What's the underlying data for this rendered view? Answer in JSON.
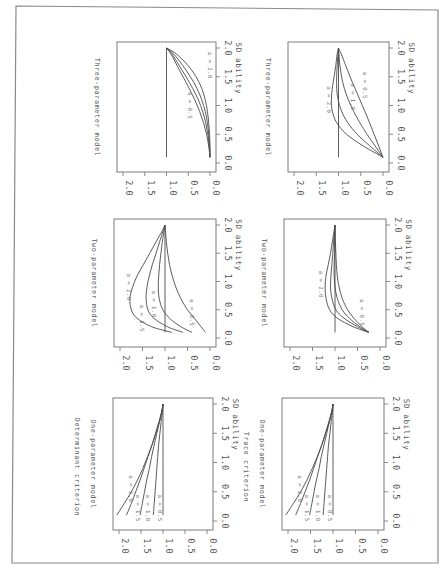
{
  "figure": {
    "orientation": "rotated-90-clockwise",
    "criteria": [
      "Determinant criterion",
      "Trace criterion"
    ]
  },
  "chart_data": [
    {
      "type": "line",
      "id": "det-one",
      "criterion": "Determinant criterion",
      "title": "One-parameter model",
      "xlabel": "SD ability",
      "ylabel": "",
      "xlim": [
        0,
        2
      ],
      "ylim": [
        0,
        2
      ],
      "xticks": [
        "0.0",
        "0.5",
        "1.0",
        "1.5",
        "2.0"
      ],
      "yticks": [
        "0.0",
        "0.5",
        "1.0",
        "1.5",
        "2.0"
      ],
      "x": [
        0.1,
        0.3,
        0.5,
        0.7,
        0.9,
        1.1,
        1.3,
        1.5,
        1.7,
        1.9,
        2.0
      ],
      "series": [
        {
          "name": "a = 0.5",
          "values": [
            1.0,
            1.0,
            1.0,
            1.0,
            1.0,
            1.0,
            1.0,
            1.0,
            1.0,
            1.0,
            1.0
          ],
          "label_pos": [
            0.22,
            1.12
          ]
        },
        {
          "name": "a = 1.0",
          "values": [
            1.22,
            1.2,
            1.18,
            1.16,
            1.14,
            1.12,
            1.1,
            1.07,
            1.04,
            1.01,
            1.0
          ],
          "label_pos": [
            0.22,
            1.38
          ]
        },
        {
          "name": "a = 1.5",
          "values": [
            1.52,
            1.47,
            1.42,
            1.37,
            1.31,
            1.26,
            1.2,
            1.14,
            1.08,
            1.02,
            1.0
          ],
          "label_pos": [
            0.22,
            1.62
          ]
        },
        {
          "name": "a = 2.0",
          "values": [
            1.83,
            1.72,
            1.62,
            1.52,
            1.43,
            1.34,
            1.25,
            1.17,
            1.09,
            1.02,
            1.0
          ],
          "label_pos": [
            0.55,
            1.78
          ]
        },
        {
          "name": "",
          "values": [
            2.05,
            1.88,
            1.72,
            1.58,
            1.46,
            1.35,
            1.25,
            1.16,
            1.08,
            1.02,
            1.0
          ]
        }
      ]
    },
    {
      "type": "line",
      "id": "det-two",
      "criterion": "Determinant criterion",
      "title": "Two-parameter model",
      "xlabel": "SD ability",
      "ylabel": "",
      "xlim": [
        0,
        2
      ],
      "ylim": [
        0,
        2
      ],
      "xticks": [
        "0.0",
        "0.5",
        "1.0",
        "1.5",
        "2.0"
      ],
      "yticks": [
        "0.0",
        "0.5",
        "1.0",
        "1.5",
        "2.0"
      ],
      "x": [
        0.1,
        0.2,
        0.35,
        0.5,
        0.7,
        0.9,
        1.1,
        1.3,
        1.5,
        1.7,
        1.9,
        2.0
      ],
      "reference_line": 1.0,
      "series": [
        {
          "name": "a = 0.5",
          "values": [
            0.1,
            0.2,
            0.35,
            0.5,
            0.65,
            0.76,
            0.84,
            0.9,
            0.94,
            0.97,
            0.99,
            1.0
          ],
          "label_pos": [
            0.45,
            0.45
          ]
        },
        {
          "name": "a = 1.0",
          "values": [
            0.4,
            0.65,
            0.9,
            1.05,
            1.13,
            1.15,
            1.14,
            1.12,
            1.09,
            1.06,
            1.02,
            1.0
          ],
          "label_pos": [
            0.6,
            1.3
          ]
        },
        {
          "name": "a = 1.5",
          "values": [
            0.6,
            0.95,
            1.25,
            1.38,
            1.42,
            1.4,
            1.35,
            1.28,
            1.2,
            1.12,
            1.04,
            1.0
          ],
          "label_pos": [
            0.35,
            1.55
          ]
        },
        {
          "name": "a = 2.0",
          "values": [
            0.85,
            1.3,
            1.62,
            1.75,
            1.78,
            1.72,
            1.62,
            1.48,
            1.34,
            1.2,
            1.06,
            1.0
          ],
          "label_pos": [
            0.9,
            1.85
          ]
        }
      ]
    },
    {
      "type": "line",
      "id": "det-three",
      "criterion": "Determinant criterion",
      "title": "Three-parameter model",
      "xlabel": "SD ability",
      "ylabel": "",
      "xlim": [
        0,
        2
      ],
      "ylim": [
        0,
        2
      ],
      "xticks": [
        "0.0",
        "0.5",
        "1.0",
        "1.5",
        "2.0"
      ],
      "yticks": [
        "0.0",
        "0.5",
        "1.0",
        "1.5",
        "2.0"
      ],
      "x": [
        0.1,
        0.3,
        0.5,
        0.7,
        0.9,
        1.1,
        1.3,
        1.5,
        1.7,
        1.9,
        2.0
      ],
      "reference_line": 1.0,
      "series": [
        {
          "name": "a = 0.5",
          "values": [
            0.0,
            0.03,
            0.08,
            0.15,
            0.24,
            0.35,
            0.48,
            0.62,
            0.76,
            0.9,
            1.0
          ],
          "label_pos": [
            1.0,
            0.5
          ]
        },
        {
          "name": "",
          "values": [
            0.0,
            0.02,
            0.05,
            0.1,
            0.17,
            0.27,
            0.4,
            0.55,
            0.71,
            0.88,
            1.0
          ]
        },
        {
          "name": "",
          "values": [
            0.0,
            0.01,
            0.03,
            0.06,
            0.11,
            0.19,
            0.3,
            0.45,
            0.63,
            0.84,
            1.0
          ]
        },
        {
          "name": "a = 2.0",
          "values": [
            0.0,
            0.0,
            0.01,
            0.03,
            0.06,
            0.11,
            0.19,
            0.32,
            0.51,
            0.78,
            1.0
          ],
          "label_pos": [
            1.7,
            0.05
          ]
        }
      ]
    },
    {
      "type": "line",
      "id": "trace-one",
      "criterion": "Trace criterion",
      "title": "One-parameter model",
      "xlabel": "SD ability",
      "ylabel": "",
      "xlim": [
        0,
        2
      ],
      "ylim": [
        0,
        2
      ],
      "xticks": [
        "0.0",
        "0.5",
        "1.0",
        "1.5",
        "2.0"
      ],
      "yticks": [
        "0.0",
        "0.5",
        "1.0",
        "1.5",
        "2.0"
      ],
      "x": [
        0.1,
        0.3,
        0.5,
        0.7,
        0.9,
        1.1,
        1.3,
        1.5,
        1.7,
        1.9,
        2.0
      ],
      "series": [
        {
          "name": "a = 0.5",
          "values": [
            1.0,
            1.0,
            1.0,
            1.0,
            1.0,
            1.0,
            1.0,
            1.0,
            1.0,
            1.0,
            1.0
          ],
          "label_pos": [
            0.22,
            1.12
          ]
        },
        {
          "name": "a = 1.0",
          "values": [
            1.22,
            1.2,
            1.18,
            1.16,
            1.14,
            1.12,
            1.1,
            1.07,
            1.04,
            1.01,
            1.0
          ],
          "label_pos": [
            0.22,
            1.38
          ]
        },
        {
          "name": "a = 1.5",
          "values": [
            1.52,
            1.47,
            1.42,
            1.37,
            1.31,
            1.26,
            1.2,
            1.14,
            1.08,
            1.02,
            1.0
          ],
          "label_pos": [
            0.22,
            1.62
          ]
        },
        {
          "name": "a = 2.0",
          "values": [
            1.83,
            1.72,
            1.62,
            1.52,
            1.43,
            1.34,
            1.25,
            1.17,
            1.09,
            1.02,
            1.0
          ],
          "label_pos": [
            0.55,
            1.78
          ]
        },
        {
          "name": "",
          "values": [
            2.05,
            1.88,
            1.72,
            1.58,
            1.46,
            1.35,
            1.25,
            1.16,
            1.08,
            1.02,
            1.0
          ]
        }
      ]
    },
    {
      "type": "line",
      "id": "trace-two",
      "criterion": "Trace criterion",
      "title": "Two-parameter model",
      "xlabel": "SD ability",
      "ylabel": "",
      "xlim": [
        0,
        2
      ],
      "ylim": [
        0,
        2
      ],
      "xticks": [
        "0.0",
        "0.5",
        "1.0",
        "1.5",
        "2.0"
      ],
      "yticks": [
        "0.0",
        "0.5",
        "1.0",
        "1.5",
        "2.0"
      ],
      "x": [
        0.1,
        0.2,
        0.35,
        0.5,
        0.7,
        0.9,
        1.1,
        1.3,
        1.5,
        1.7,
        1.9,
        2.0
      ],
      "reference_line": 1.0,
      "series": [
        {
          "name": "a = 0.5",
          "values": [
            0.25,
            0.4,
            0.58,
            0.72,
            0.84,
            0.91,
            0.95,
            0.97,
            0.98,
            0.99,
            1.0,
            1.0
          ],
          "label_pos": [
            0.45,
            0.45
          ]
        },
        {
          "name": "",
          "values": [
            0.25,
            0.45,
            0.68,
            0.84,
            0.95,
            1.0,
            1.02,
            1.02,
            1.01,
            1.01,
            1.0,
            1.0
          ]
        },
        {
          "name": "",
          "values": [
            0.25,
            0.5,
            0.8,
            0.98,
            1.07,
            1.1,
            1.09,
            1.07,
            1.05,
            1.03,
            1.01,
            1.0
          ]
        },
        {
          "name": "a = 2.0",
          "values": [
            0.25,
            0.6,
            0.95,
            1.12,
            1.2,
            1.22,
            1.2,
            1.15,
            1.1,
            1.06,
            1.02,
            1.0
          ],
          "label_pos": [
            0.95,
            1.35
          ]
        }
      ]
    },
    {
      "type": "line",
      "id": "trace-three",
      "criterion": "Trace criterion",
      "title": "Three-parameter model",
      "xlabel": "SD ability",
      "ylabel": "",
      "xlim": [
        0,
        2
      ],
      "ylim": [
        0,
        2
      ],
      "xticks": [
        "0.0",
        "0.5",
        "1.0",
        "1.5",
        "2.0"
      ],
      "yticks": [
        "0.0",
        "0.5",
        "1.0",
        "1.5",
        "2.0"
      ],
      "x": [
        0.1,
        0.3,
        0.5,
        0.7,
        0.9,
        1.1,
        1.3,
        1.5,
        1.7,
        1.9,
        2.0
      ],
      "reference_line": 1.0,
      "series": [
        {
          "name": "a = 0.5",
          "values": [
            0.0,
            0.1,
            0.2,
            0.3,
            0.41,
            0.52,
            0.63,
            0.74,
            0.84,
            0.94,
            1.0
          ],
          "label_pos": [
            1.35,
            0.45
          ]
        },
        {
          "name": "a = 1.0",
          "values": [
            0.0,
            0.18,
            0.36,
            0.52,
            0.66,
            0.78,
            0.87,
            0.93,
            0.97,
            0.99,
            1.0
          ],
          "label_pos": [
            1.15,
            0.72
          ]
        },
        {
          "name": "",
          "values": [
            0.0,
            0.3,
            0.58,
            0.79,
            0.93,
            1.01,
            1.04,
            1.04,
            1.03,
            1.01,
            1.0
          ]
        },
        {
          "name": "a = 2.0",
          "values": [
            0.0,
            0.45,
            0.82,
            1.04,
            1.14,
            1.16,
            1.14,
            1.1,
            1.06,
            1.03,
            1.0
          ],
          "label_pos": [
            1.1,
            1.25
          ]
        }
      ]
    }
  ],
  "panels_layout": [
    {
      "chart": "det-three",
      "box": [
        117,
        42,
        216,
        172
      ]
    },
    {
      "chart": "trace-three",
      "box": [
        288,
        42,
        389,
        172
      ]
    },
    {
      "chart": "det-two",
      "box": [
        114,
        219,
        216,
        347
      ]
    },
    {
      "chart": "trace-two",
      "box": [
        284,
        219,
        386,
        347
      ]
    },
    {
      "chart": "det-one",
      "box": [
        113,
        398,
        213,
        530
      ]
    },
    {
      "chart": "trace-one",
      "box": [
        282,
        398,
        384,
        530
      ]
    }
  ],
  "page_frame": [
    14,
    6,
    438,
    563
  ]
}
